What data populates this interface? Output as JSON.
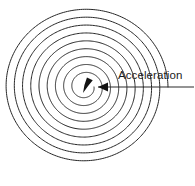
{
  "figure": {
    "background_color": "#ffffff",
    "width": 195,
    "height": 186,
    "annotation": {
      "label": "Acceleration",
      "label_color": "#1b1b1b",
      "label_x": 118,
      "label_y": 69,
      "font_size": 11.5
    },
    "leader": {
      "line_color": "#2b2b2b",
      "start_x": 194,
      "start_y": 87,
      "end_x": 98,
      "end_y": 87,
      "arrow_color": "#131313",
      "arrow_tip_x": 98,
      "arrow_tip_y": 87,
      "arrow_length": 10,
      "arrow_half_width": 4.5
    },
    "center_arrow": {
      "description": "filled teardrop acceleration vector at spiral center",
      "color": "#131313",
      "tip_x": 83,
      "tip_y": 93,
      "tail_x": 90,
      "tail_y": 79
    },
    "spiral": {
      "type": "archimedean",
      "center_x": 85,
      "center_y": 87,
      "stroke_color": "#262626",
      "stroke_width": 1,
      "turns": 9,
      "inner_radius": 9,
      "outer_radius": 83,
      "ring_spacing": 8.2,
      "start_angle_deg": 0,
      "x_scale": 1.0,
      "y_scale": 0.96
    }
  },
  "chart_data": {
    "type": "line",
    "title": "Acceleration",
    "xlabel": "",
    "ylabel": "",
    "series": [
      {
        "name": "spiral-trajectory",
        "description": "Archimedean spiral r = a + b*theta traced over 9 revolutions",
        "a": 9,
        "b": 1.305,
        "theta_start_deg": 0,
        "theta_end_deg": 3240,
        "r_start": 9,
        "r_end": 83
      },
      {
        "name": "acceleration-vector",
        "description": "arrow at spiral center indicating acceleration direction",
        "from": [
          90,
          79
        ],
        "to": [
          83,
          93
        ]
      }
    ],
    "annotations": [
      {
        "text": "Acceleration",
        "x": 118,
        "y": 69,
        "leader_from": [
          194,
          87
        ],
        "leader_to": [
          98,
          87
        ]
      }
    ],
    "grid": false,
    "legend": "none"
  }
}
